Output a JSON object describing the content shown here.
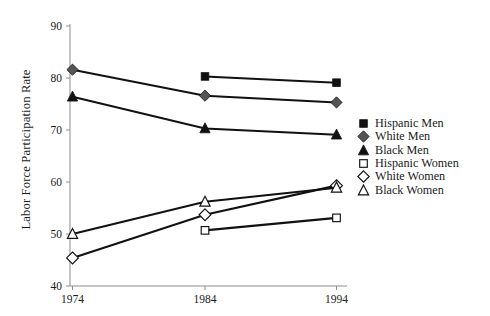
{
  "chart_data": {
    "type": "line",
    "title": "",
    "xlabel": "",
    "ylabel": "Labor Force Participation Rate",
    "categories": [
      "1974",
      "1984",
      "1994"
    ],
    "x": [
      1974,
      1984,
      1994
    ],
    "xlim": [
      1970,
      1998
    ],
    "ylim": [
      40,
      90
    ],
    "yticks": [
      40,
      50,
      60,
      70,
      80,
      90
    ],
    "xticks": [
      1974,
      1984,
      1994
    ],
    "grid": false,
    "legend_position": "right",
    "series": [
      {
        "name": "Hispanic Men",
        "marker": "filled-square",
        "color": "#111111",
        "x": [
          1984,
          1994
        ],
        "values": [
          80.3,
          79.1
        ]
      },
      {
        "name": "White Men",
        "marker": "filled-diamond",
        "color": "#555555",
        "x": [
          1974,
          1984,
          1994
        ],
        "values": [
          81.6,
          76.6,
          75.3
        ]
      },
      {
        "name": "Black Men",
        "marker": "filled-triangle",
        "color": "#111111",
        "x": [
          1974,
          1984,
          1994
        ],
        "values": [
          76.4,
          70.3,
          69.1
        ]
      },
      {
        "name": "Hispanic Women",
        "marker": "open-square",
        "color": "#ffffff",
        "x": [
          1984,
          1994
        ],
        "values": [
          50.7,
          53.1
        ]
      },
      {
        "name": "White Women",
        "marker": "open-diamond",
        "color": "#ffffff",
        "x": [
          1974,
          1984,
          1994
        ],
        "values": [
          45.4,
          53.7,
          59.3
        ]
      },
      {
        "name": "Black Women",
        "marker": "open-triangle",
        "color": "#ffffff",
        "x": [
          1974,
          1984,
          1994
        ],
        "values": [
          50.0,
          56.2,
          58.9
        ]
      }
    ]
  },
  "axes": {
    "y_tick_labels": [
      "90",
      "80",
      "70",
      "60",
      "50",
      "40"
    ],
    "x_tick_labels": [
      "1974",
      "1984",
      "1994"
    ],
    "y_axis_title": "Labor Force Participation Rate"
  },
  "legend": {
    "items": [
      {
        "label": "Hispanic Men",
        "marker": "filled-square"
      },
      {
        "label": "White Men",
        "marker": "filled-diamond"
      },
      {
        "label": "Black Men",
        "marker": "filled-triangle"
      },
      {
        "label": "Hispanic Women",
        "marker": "open-square"
      },
      {
        "label": "White Women",
        "marker": "open-diamond"
      },
      {
        "label": "Black Women",
        "marker": "open-triangle"
      }
    ]
  },
  "colors": {
    "line": "#111111",
    "axis": "#8c8c8c",
    "white_men_marker": "#555555",
    "background": "#ffffff"
  }
}
